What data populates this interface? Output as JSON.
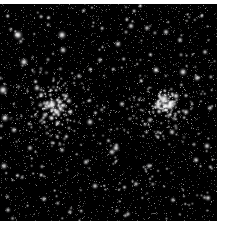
{
  "image": {
    "kind": "astronomical-photograph",
    "subject": "Double Cluster (open star clusters h and Chi Persei)",
    "width": 225,
    "height": 227,
    "background_color": "#ffffff",
    "sky_color": "#000000",
    "star_color": "#ffffff",
    "caption": "",
    "alt_text": "Dense black star field containing two open star clusters"
  },
  "frame": {
    "field_x": 0,
    "field_y": 4,
    "field_width": 217,
    "field_height": 217,
    "border_top_px": 4,
    "border_right_px": 8,
    "border_bottom_px": 6,
    "border_left_px": 0,
    "border_color": "#ffffff"
  },
  "chart_data": {
    "type": "scatter",
    "title": "",
    "xlabel": "",
    "ylabel": "",
    "xlim": [
      0,
      217
    ],
    "ylim": [
      4,
      221
    ],
    "grid": false,
    "legend": false,
    "background": "#000000",
    "point_color": "#ffffff",
    "clusters": [
      {
        "name": "left-cluster",
        "designation": "NGC 869 (h Persei)",
        "center_x": 52,
        "center_y": 107,
        "core_radius": 16,
        "halo_radius": 46,
        "core_star_count": 70,
        "halo_star_count": 150,
        "peak_brightness": 1.0
      },
      {
        "name": "right-cluster",
        "designation": "NGC 884 (Chi Persei)",
        "center_x": 166,
        "center_y": 104,
        "core_radius": 12,
        "halo_radius": 40,
        "core_star_count": 80,
        "halo_star_count": 130,
        "peak_brightness": 1.0
      }
    ],
    "field_star_count": 2600,
    "field_star_seed": 20240517,
    "bright_stars": [
      {
        "x": 18,
        "y": 35,
        "r": 2.6,
        "b": 1.0
      },
      {
        "x": 62,
        "y": 35,
        "r": 2.4,
        "b": 0.96
      },
      {
        "x": 63,
        "y": 50,
        "r": 2.0,
        "b": 0.88
      },
      {
        "x": 24,
        "y": 62,
        "r": 2.3,
        "b": 0.94
      },
      {
        "x": 3,
        "y": 90,
        "r": 2.6,
        "b": 0.98
      },
      {
        "x": 5,
        "y": 118,
        "r": 2.2,
        "b": 0.9
      },
      {
        "x": 37,
        "y": 88,
        "r": 1.9,
        "b": 0.85
      },
      {
        "x": 52,
        "y": 104,
        "r": 2.8,
        "b": 1.0
      },
      {
        "x": 57,
        "y": 112,
        "r": 2.4,
        "b": 0.95
      },
      {
        "x": 45,
        "y": 115,
        "r": 1.8,
        "b": 0.82
      },
      {
        "x": 66,
        "y": 96,
        "r": 1.7,
        "b": 0.8
      },
      {
        "x": 14,
        "y": 130,
        "r": 1.8,
        "b": 0.83
      },
      {
        "x": 30,
        "y": 148,
        "r": 1.7,
        "b": 0.8
      },
      {
        "x": 4,
        "y": 166,
        "r": 2.0,
        "b": 0.86
      },
      {
        "x": 62,
        "y": 150,
        "r": 1.6,
        "b": 0.78
      },
      {
        "x": 86,
        "y": 162,
        "r": 1.7,
        "b": 0.8
      },
      {
        "x": 90,
        "y": 122,
        "r": 2.0,
        "b": 0.88
      },
      {
        "x": 95,
        "y": 186,
        "r": 1.8,
        "b": 0.83
      },
      {
        "x": 112,
        "y": 152,
        "r": 1.9,
        "b": 0.85
      },
      {
        "x": 118,
        "y": 44,
        "r": 1.9,
        "b": 0.86
      },
      {
        "x": 131,
        "y": 26,
        "r": 1.8,
        "b": 0.84
      },
      {
        "x": 147,
        "y": 28,
        "r": 1.7,
        "b": 0.8
      },
      {
        "x": 166,
        "y": 32,
        "r": 1.8,
        "b": 0.82
      },
      {
        "x": 180,
        "y": 40,
        "r": 1.7,
        "b": 0.8
      },
      {
        "x": 156,
        "y": 70,
        "r": 2.0,
        "b": 0.88
      },
      {
        "x": 183,
        "y": 72,
        "r": 2.2,
        "b": 0.92
      },
      {
        "x": 197,
        "y": 78,
        "r": 1.9,
        "b": 0.86
      },
      {
        "x": 164,
        "y": 99,
        "r": 3.2,
        "b": 1.0
      },
      {
        "x": 170,
        "y": 106,
        "r": 2.8,
        "b": 1.0
      },
      {
        "x": 158,
        "y": 104,
        "r": 2.4,
        "b": 0.96
      },
      {
        "x": 176,
        "y": 96,
        "r": 2.0,
        "b": 0.9
      },
      {
        "x": 186,
        "y": 112,
        "r": 1.8,
        "b": 0.84
      },
      {
        "x": 150,
        "y": 120,
        "r": 1.7,
        "b": 0.8
      },
      {
        "x": 172,
        "y": 132,
        "r": 1.8,
        "b": 0.83
      },
      {
        "x": 122,
        "y": 104,
        "r": 1.7,
        "b": 0.8
      },
      {
        "x": 116,
        "y": 148,
        "r": 2.1,
        "b": 0.9
      },
      {
        "x": 149,
        "y": 166,
        "r": 1.7,
        "b": 0.8
      },
      {
        "x": 196,
        "y": 160,
        "r": 1.8,
        "b": 0.84
      },
      {
        "x": 207,
        "y": 146,
        "r": 1.9,
        "b": 0.86
      },
      {
        "x": 208,
        "y": 198,
        "r": 1.8,
        "b": 0.83
      },
      {
        "x": 173,
        "y": 200,
        "r": 1.6,
        "b": 0.78
      },
      {
        "x": 44,
        "y": 199,
        "r": 1.7,
        "b": 0.8
      },
      {
        "x": 100,
        "y": 60,
        "r": 1.6,
        "b": 0.78
      },
      {
        "x": 79,
        "y": 76,
        "r": 1.6,
        "b": 0.77
      },
      {
        "x": 136,
        "y": 184,
        "r": 1.6,
        "b": 0.77
      },
      {
        "x": 205,
        "y": 52,
        "r": 1.6,
        "b": 0.78
      },
      {
        "x": 210,
        "y": 108,
        "r": 1.7,
        "b": 0.8
      },
      {
        "x": 8,
        "y": 210,
        "r": 1.6,
        "b": 0.76
      },
      {
        "x": 70,
        "y": 212,
        "r": 1.5,
        "b": 0.74
      },
      {
        "x": 128,
        "y": 214,
        "r": 1.5,
        "b": 0.74
      }
    ]
  }
}
